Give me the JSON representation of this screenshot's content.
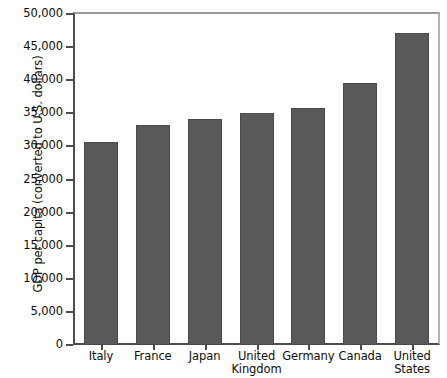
{
  "chart_data": {
    "type": "bar",
    "title": "",
    "xlabel": "",
    "ylabel": "GDP per capita (converted to U.S. dollars)",
    "categories": [
      "Italy",
      "France",
      "Japan",
      "United\nKingdom",
      "Germany",
      "Canada",
      "United\nStates"
    ],
    "values": [
      30700,
      33300,
      34200,
      35000,
      35800,
      39600,
      47100
    ],
    "ylim": [
      0,
      50000
    ],
    "ytick_values": [
      0,
      5000,
      10000,
      15000,
      20000,
      25000,
      30000,
      35000,
      40000,
      45000,
      50000
    ],
    "ytick_labels": [
      "0",
      "5,000",
      "10,000",
      "15,000",
      "20,000",
      "25,000",
      "30,000",
      "35,000",
      "40,000",
      "45,000",
      "50,000"
    ],
    "grid": false,
    "legend": false,
    "legend_position": "none",
    "bar_color": "#595959",
    "bar_edge_color": "#4a4a4a",
    "axis_color": "#4d4d4d",
    "background_color": "#ffffff"
  }
}
